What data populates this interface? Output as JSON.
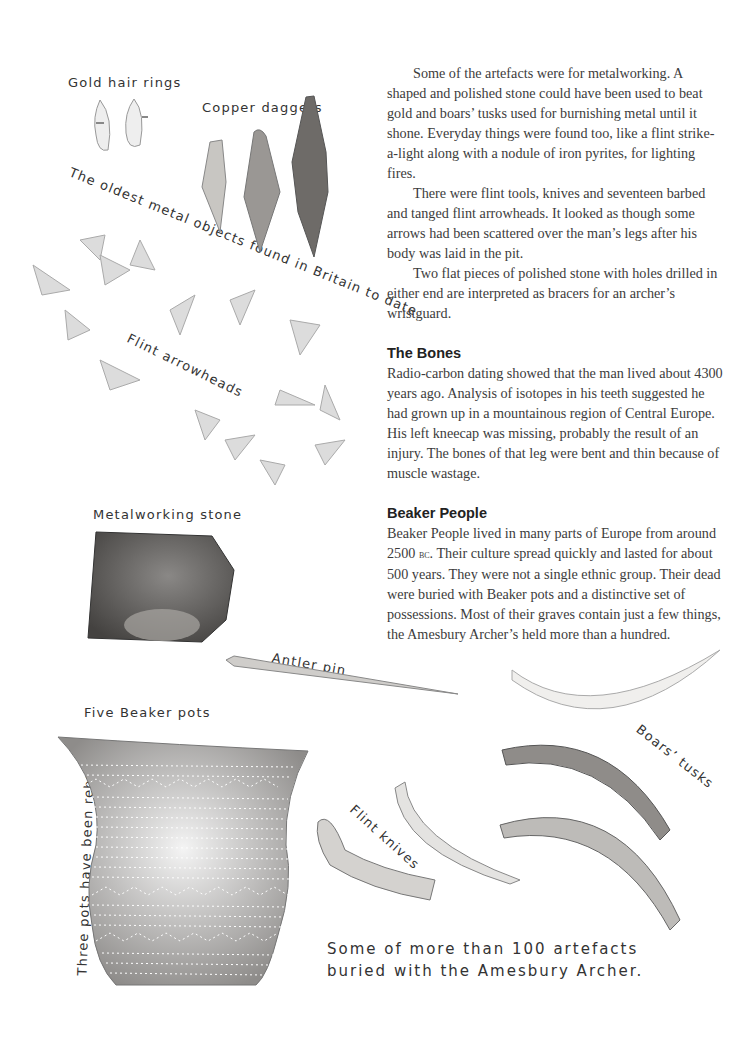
{
  "article": {
    "paragraphs": [
      "Some of the artefacts were for metalworking. A shaped and polished stone could have been used to beat gold and boars’ tusks used for burnishing metal until it shone. Everyday things were found too, like a flint strike-a-light along with a nodule of iron pyrites, for lighting fires.",
      "There were flint tools, knives and seventeen barbed and tanged flint arrowheads. It looked as though some arrows had been scattered over the man’s legs after his body was laid in the pit.",
      "Two flat pieces of polished stone with holes drilled in either end are interpreted as bracers for an archer’s wristguard."
    ],
    "sections": [
      {
        "heading": "The Bones",
        "body": "Radio-carbon dating showed that the man lived about 4300 years ago.  Analysis of isotopes in his teeth suggested he had grown up in a mountainous region of Central Europe. His left kneecap was missing, probably the result of an injury. The bones of that leg were bent and thin because of muscle wastage."
      },
      {
        "heading": "Beaker People",
        "body_before": "Beaker People lived in many parts of Europe from around 2500 ",
        "body_era": "bc",
        "body_after": ". Their culture spread quickly and lasted for about 500 years. They were not a single ethnic group. Their dead were buried with Beaker pots and a distinctive set of possessions. Most of their graves contain just a few things, the Amesbury Archer’s held more than a hundred."
      }
    ]
  },
  "labels": {
    "gold_hair_rings": "Gold hair rings",
    "copper_daggers": "Copper daggers",
    "oldest_metal": "The oldest metal objects found in Britain to date",
    "flint_arrowheads": "Flint arrowheads",
    "metalworking_stone": "Metalworking stone",
    "antler_pin": "Antler pin",
    "five_beaker_pots": "Five Beaker pots",
    "boars_tusks": "Boars’ tusks",
    "three_pots_rebuilt": "Three pots have been rebuilt",
    "flint_knives": "Flint knives",
    "caption_line1": "Some of more than 100 artefacts",
    "caption_line2": "buried with the Amesbury Archer."
  }
}
